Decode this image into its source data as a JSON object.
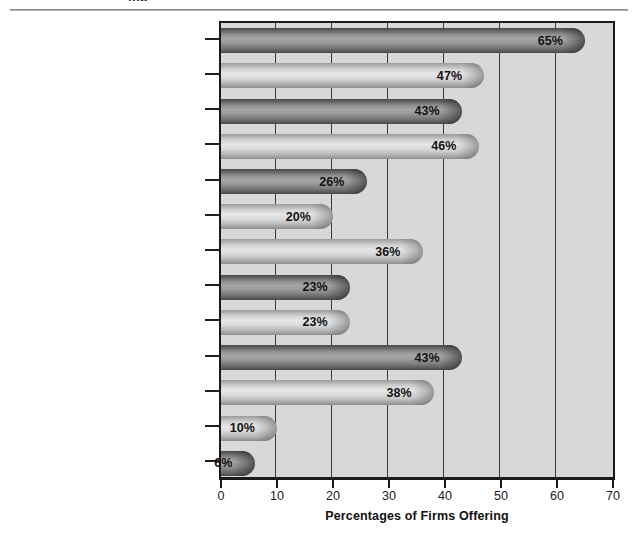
{
  "page": {
    "clipped_heading": "mp"
  },
  "chart_data": {
    "type": "bar",
    "orientation": "horizontal",
    "title": "",
    "xlabel": "Percentages of Firms Offering",
    "ylabel": "",
    "xlim": [
      0,
      70
    ],
    "xticks": [
      0,
      10,
      20,
      30,
      40,
      50,
      60,
      70
    ],
    "xtick_labels": [
      "0",
      "10",
      "20",
      "30",
      "40",
      "50",
      "60",
      "70"
    ],
    "grid": true,
    "legend": "none",
    "value_suffix": "%",
    "categories": [
      "Annual Physical",
      "Company Car",
      "Car Allowance",
      "Car Phone",
      "First-class Air Travel",
      "Company Airplane Usage",
      "Country Club Membership",
      "Health Club Membership",
      "Luncheon Club Membership",
      "Financial Planning",
      "Tax Planning/Tax Return Preparation",
      "Legal Counseling",
      "No/Low-Interest Loans"
    ],
    "values": [
      65,
      47,
      43,
      46,
      26,
      20,
      36,
      23,
      23,
      43,
      38,
      10,
      6
    ],
    "value_labels": [
      "65%",
      "47%",
      "43%",
      "46%",
      "26%",
      "20%",
      "36%",
      "23%",
      "23%",
      "43%",
      "38%",
      "10%",
      "6%"
    ],
    "bar_shades": [
      "dark",
      "light",
      "dark",
      "light",
      "dark",
      "light",
      "light",
      "dark",
      "light",
      "dark",
      "light",
      "light",
      "dark"
    ],
    "colors": {
      "plot_background": "#d8d8d6",
      "frame": "#1a1a1a",
      "gridline": "#3a3a3a",
      "bar_dark": "#7d7d7d",
      "bar_light": "#c8c8c8",
      "label_text": "#232323",
      "value_text": "#111111"
    }
  }
}
